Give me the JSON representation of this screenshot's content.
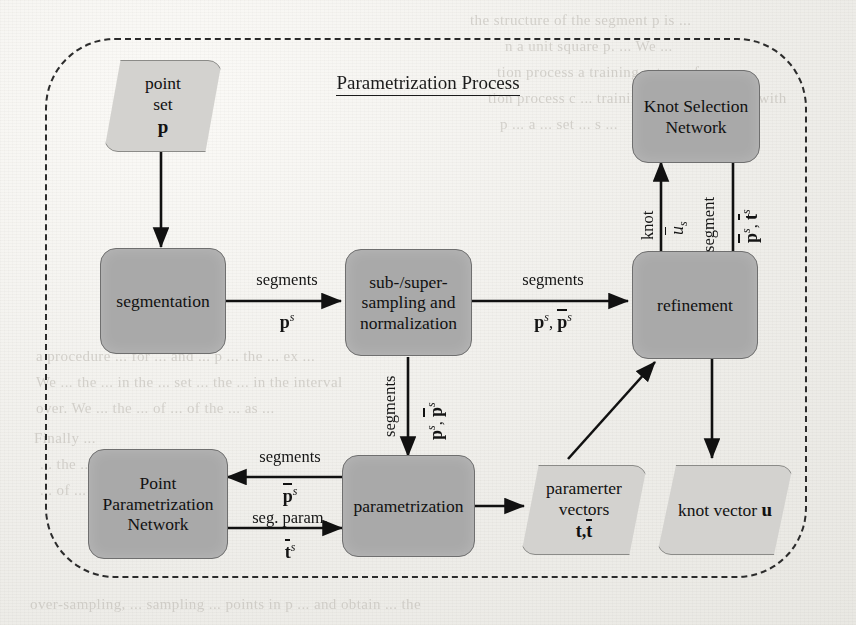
{
  "diagram": {
    "title": "Parametrization Process",
    "type": "flowchart",
    "nodes": [
      {
        "id": "point-set",
        "shape": "parallelogram",
        "lines": [
          "point",
          "set",
          "p"
        ]
      },
      {
        "id": "segmentation",
        "shape": "rounded-rect",
        "lines": [
          "segmentation"
        ]
      },
      {
        "id": "subsampling",
        "shape": "rounded-rect",
        "lines": [
          "sub-/super-",
          "sampling and",
          "normalization"
        ]
      },
      {
        "id": "refinement",
        "shape": "rounded-rect",
        "lines": [
          "refinement"
        ]
      },
      {
        "id": "knot-selection",
        "shape": "rounded-rect",
        "lines": [
          "Knot Selection",
          "Network"
        ]
      },
      {
        "id": "point-param-net",
        "shape": "rounded-rect",
        "lines": [
          "Point",
          "Parametrization",
          "Network"
        ]
      },
      {
        "id": "parametrization",
        "shape": "rounded-rect",
        "lines": [
          "parametrization"
        ]
      },
      {
        "id": "param-vectors",
        "shape": "parallelogram",
        "lines": [
          "paramerter",
          "vectors",
          "t, t"
        ]
      },
      {
        "id": "knot-vector",
        "shape": "parallelogram",
        "lines": [
          "knot vector u"
        ]
      }
    ],
    "edges": [
      {
        "id": "e-pointset-seg",
        "from": "point-set",
        "to": "segmentation",
        "label_top": "",
        "label_bottom": ""
      },
      {
        "id": "e-seg-sub",
        "from": "segmentation",
        "to": "subsampling",
        "label_top": "segments",
        "label_bottom": "p^s"
      },
      {
        "id": "e-sub-refine",
        "from": "subsampling",
        "to": "refinement",
        "label_top": "segments",
        "label_bottom": "p^s, p̄^s"
      },
      {
        "id": "e-sub-param",
        "from": "subsampling",
        "to": "parametrization",
        "label_top": "segments",
        "label_bottom": "p^s, p̄^s"
      },
      {
        "id": "e-refine-knotnet",
        "from": "refinement",
        "to": "knot-selection",
        "label_top": "knot",
        "label_bottom": "ū_s"
      },
      {
        "id": "e-knotnet-refine",
        "from": "knot-selection",
        "to": "refinement",
        "label_top": "segment",
        "label_bottom": "p̄^s, t̄^s"
      },
      {
        "id": "e-param-ppn",
        "from": "parametrization",
        "to": "point-param-net",
        "label_top": "segments",
        "label_bottom": "p̄^s"
      },
      {
        "id": "e-ppn-param",
        "from": "point-param-net",
        "to": "parametrization",
        "label_top": "seg. param.",
        "label_bottom": "t̄^s"
      },
      {
        "id": "e-param-vectors",
        "from": "parametrization",
        "to": "param-vectors",
        "label_top": "",
        "label_bottom": ""
      },
      {
        "id": "e-vectors-refine",
        "from": "param-vectors",
        "to": "refinement",
        "label_top": "",
        "label_bottom": ""
      },
      {
        "id": "e-refine-knotvec",
        "from": "refinement",
        "to": "knot-vector",
        "label_top": "",
        "label_bottom": ""
      }
    ],
    "labels": {
      "segments": "segments",
      "segment": "segment",
      "knot": "knot",
      "seg_param": "seg. param."
    },
    "colors": {
      "process_fill": "#a9a9a9",
      "process_stroke": "#6f6f6f",
      "io_fill": "#d3d2cf",
      "io_stroke": "#8b8b88",
      "line": "#111111",
      "page_bg": "#f2f1ee"
    }
  },
  "node_text": {
    "point_set_l1": "point",
    "point_set_l2": "set",
    "point_set_sym": "p",
    "segmentation": "segmentation",
    "sub_l1": "sub-/super-",
    "sub_l2": "sampling and",
    "sub_l3": "normalization",
    "refinement": "refinement",
    "knotnet_l1": "Knot Selection",
    "knotnet_l2": "Network",
    "ppn_l1": "Point",
    "ppn_l2": "Parametrization",
    "ppn_l3": "Network",
    "parametrization": "parametrization",
    "pv_l1": "paramerter",
    "pv_l2": "vectors",
    "kv_l1": "knot vector",
    "kv_sym": "u",
    "t_plain": "t,",
    "t_bar": "t"
  },
  "edge_text": {
    "seg_sub_top": "segments",
    "seg_sub_p": "p",
    "sub_ref_top": "segments",
    "sub_par_top": "segments",
    "knot_word": "knot",
    "knot_u": "u",
    "knot_u_sub": "s",
    "segment_word": "segment",
    "ppn_in_top": "segments",
    "ppn_out_top": "seg. param.",
    "sup_s": "s",
    "p_sym": "p",
    "t_sym": "t",
    "comma": ","
  },
  "bleed_through": [
    {
      "t": "the structure of the segment p is ...",
      "x": 470,
      "y": 12
    },
    {
      "t": "n a unit square p. ... We ...",
      "x": 505,
      "y": 38
    },
    {
      "t": "tion process a training set p ... for non-",
      "x": 497,
      "y": 64
    },
    {
      "t": "tion process c ... training set of a segment with",
      "x": 488,
      "y": 90
    },
    {
      "t": "p ... a ... set ... s ...",
      "x": 500,
      "y": 116
    },
    {
      "t": "a procedure ... for ... and ... p ... the ... ex ...",
      "x": 36,
      "y": 348
    },
    {
      "t": "We ... the ... in the ... set ... the ... in the interval",
      "x": 36,
      "y": 374
    },
    {
      "t": "over. We ... the ... of ... of the ... as ...",
      "x": 36,
      "y": 400
    },
    {
      "t": "Finally ...",
      "x": 34,
      "y": 430
    },
    {
      "t": "... the ...",
      "x": 40,
      "y": 456
    },
    {
      "t": "... of ...",
      "x": 40,
      "y": 482
    },
    {
      "t": "over-sampling, ... sampling ... points in p ... and obtain ... the",
      "x": 30,
      "y": 596
    }
  ]
}
